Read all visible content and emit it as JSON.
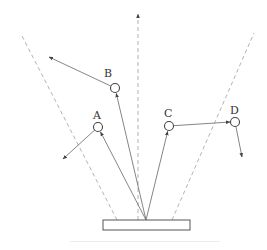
{
  "diagram": {
    "type": "particle-scattering-schematic",
    "colors": {
      "stroke": "#777777",
      "dashed": "#aaaaaa",
      "circle": "#444444",
      "label": "#333333"
    },
    "source_plate": {
      "x": 103,
      "y": 220,
      "width": 87,
      "height": 10
    },
    "origin": {
      "x": 146,
      "y": 220
    },
    "boundary_lines": [
      {
        "name": "left-boundary",
        "x1": 117,
        "y1": 220,
        "x2": 22,
        "y2": 36
      },
      {
        "name": "right-boundary",
        "x1": 172,
        "y1": 220,
        "x2": 254,
        "y2": 33
      }
    ],
    "center_axis": {
      "x1": 138,
      "y1": 220,
      "x2": 138,
      "y2": 14
    },
    "particles": [
      {
        "label": "A",
        "cx": 98,
        "cy": 127,
        "label_x": 93,
        "label_y": 119,
        "exit": {
          "x": 63,
          "y": 159
        }
      },
      {
        "label": "B",
        "cx": 115,
        "cy": 88,
        "label_x": 104,
        "label_y": 77,
        "exit": {
          "x": 49,
          "y": 57
        }
      },
      {
        "label": "C",
        "cx": 169,
        "cy": 126,
        "label_x": 164,
        "label_y": 117,
        "exit": {
          "x": 230,
          "y": 122
        }
      },
      {
        "label": "D",
        "cx": 235,
        "cy": 122,
        "label_x": 230,
        "label_y": 114,
        "exit": {
          "x": 242,
          "y": 157
        }
      }
    ]
  }
}
